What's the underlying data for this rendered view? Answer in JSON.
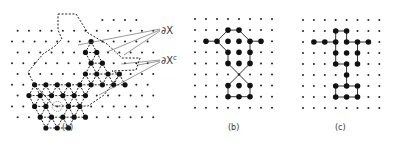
{
  "figure": {
    "panels": [
      {
        "id": "a",
        "caption": "(a)"
      },
      {
        "id": "b",
        "caption": "(b)"
      },
      {
        "id": "c",
        "caption": "(c)"
      }
    ],
    "annotations": {
      "boundary_label": "∂X",
      "complement_boundary_label": "∂X",
      "complement_superscript": "c"
    }
  },
  "panel_a": {
    "lattice": "triangular",
    "origin": [
      12,
      22
    ],
    "dx": 11.3,
    "dy": 10.8,
    "rows": 10,
    "cols": 13,
    "cluster": [
      [
        2,
        7
      ],
      [
        3,
        7
      ],
      [
        3,
        6
      ],
      [
        4,
        7
      ],
      [
        4,
        8
      ],
      [
        5,
        6
      ],
      [
        5,
        7
      ],
      [
        5,
        8
      ],
      [
        5,
        9
      ],
      [
        6,
        2
      ],
      [
        6,
        3
      ],
      [
        6,
        4
      ],
      [
        6,
        5
      ],
      [
        6,
        6
      ],
      [
        6,
        7
      ],
      [
        6,
        8
      ],
      [
        6,
        9
      ],
      [
        6,
        10
      ],
      [
        7,
        1
      ],
      [
        7,
        2
      ],
      [
        7,
        3
      ],
      [
        7,
        4
      ],
      [
        7,
        5
      ],
      [
        7,
        6
      ],
      [
        8,
        2
      ],
      [
        8,
        3
      ],
      [
        8,
        5
      ],
      [
        8,
        6
      ],
      [
        9,
        2
      ],
      [
        9,
        3
      ],
      [
        9,
        4
      ],
      [
        9,
        5
      ],
      [
        9,
        6
      ],
      [
        10,
        3
      ],
      [
        10,
        4
      ],
      [
        10,
        5
      ]
    ],
    "center_circle": [
      8,
      4
    ],
    "colors": {
      "ink": "#111111",
      "leader": "#555555"
    }
  },
  "panel_b": {
    "origin": [
      195,
      19
    ],
    "dx": 11,
    "dy": 11.1,
    "rows": 9,
    "cols": 8,
    "filled": [
      [
        1,
        3
      ],
      [
        1,
        4
      ],
      [
        2,
        1
      ],
      [
        2,
        2
      ],
      [
        2,
        3
      ],
      [
        2,
        4
      ],
      [
        2,
        5
      ],
      [
        2,
        6
      ],
      [
        3,
        3
      ],
      [
        3,
        4
      ],
      [
        3,
        5
      ],
      [
        4,
        3
      ],
      [
        4,
        4
      ],
      [
        4,
        5
      ],
      [
        5,
        4
      ],
      [
        6,
        3
      ],
      [
        6,
        4
      ],
      [
        6,
        5
      ],
      [
        7,
        3
      ],
      [
        7,
        4
      ],
      [
        7,
        5
      ]
    ],
    "edges": [
      [
        [
          2,
          1
        ],
        [
          2,
          2
        ]
      ],
      [
        [
          2,
          2
        ],
        [
          1,
          3
        ]
      ],
      [
        [
          1,
          3
        ],
        [
          1,
          4
        ]
      ],
      [
        [
          1,
          4
        ],
        [
          2,
          5
        ]
      ],
      [
        [
          2,
          5
        ],
        [
          2,
          6
        ]
      ],
      [
        [
          2,
          2
        ],
        [
          3,
          3
        ]
      ],
      [
        [
          3,
          3
        ],
        [
          4,
          3
        ]
      ],
      [
        [
          2,
          5
        ],
        [
          3,
          5
        ]
      ],
      [
        [
          3,
          5
        ],
        [
          4,
          5
        ]
      ],
      [
        [
          4,
          3
        ],
        [
          6,
          5
        ]
      ],
      [
        [
          4,
          5
        ],
        [
          6,
          3
        ]
      ],
      [
        [
          6,
          3
        ],
        [
          7,
          3
        ]
      ],
      [
        [
          7,
          3
        ],
        [
          7,
          4
        ]
      ],
      [
        [
          7,
          4
        ],
        [
          7,
          5
        ]
      ],
      [
        [
          7,
          5
        ],
        [
          6,
          5
        ]
      ]
    ]
  },
  "panel_c": {
    "origin": [
      303,
      20
    ],
    "dx": 10.9,
    "dy": 11,
    "rows": 9,
    "cols": 8,
    "filled": [
      [
        2,
        1
      ],
      [
        2,
        2
      ],
      [
        2,
        3
      ],
      [
        2,
        4
      ],
      [
        2,
        5
      ],
      [
        2,
        6
      ],
      [
        1,
        3
      ],
      [
        1,
        4
      ],
      [
        3,
        3
      ],
      [
        3,
        4
      ],
      [
        3,
        5
      ],
      [
        4,
        3
      ],
      [
        4,
        4
      ],
      [
        4,
        5
      ],
      [
        5,
        4
      ],
      [
        6,
        3
      ],
      [
        6,
        4
      ],
      [
        6,
        5
      ],
      [
        7,
        3
      ],
      [
        7,
        4
      ],
      [
        7,
        5
      ]
    ],
    "edges": [
      [
        [
          2,
          1
        ],
        [
          2,
          2
        ]
      ],
      [
        [
          2,
          2
        ],
        [
          2,
          3
        ]
      ],
      [
        [
          2,
          3
        ],
        [
          1,
          3
        ]
      ],
      [
        [
          1,
          3
        ],
        [
          1,
          4
        ]
      ],
      [
        [
          1,
          4
        ],
        [
          2,
          4
        ]
      ],
      [
        [
          2,
          4
        ],
        [
          2,
          5
        ]
      ],
      [
        [
          2,
          5
        ],
        [
          2,
          6
        ]
      ],
      [
        [
          2,
          3
        ],
        [
          3,
          3
        ]
      ],
      [
        [
          3,
          3
        ],
        [
          4,
          3
        ]
      ],
      [
        [
          4,
          3
        ],
        [
          4,
          4
        ]
      ],
      [
        [
          2,
          5
        ],
        [
          3,
          5
        ]
      ],
      [
        [
          3,
          5
        ],
        [
          4,
          5
        ]
      ],
      [
        [
          4,
          4
        ],
        [
          5,
          4
        ]
      ],
      [
        [
          5,
          4
        ],
        [
          6,
          4
        ]
      ],
      [
        [
          6,
          3
        ],
        [
          6,
          4
        ]
      ],
      [
        [
          6,
          4
        ],
        [
          6,
          5
        ]
      ],
      [
        [
          6,
          5
        ],
        [
          7,
          5
        ]
      ],
      [
        [
          7,
          5
        ],
        [
          7,
          4
        ]
      ],
      [
        [
          7,
          4
        ],
        [
          7,
          3
        ]
      ],
      [
        [
          7,
          3
        ],
        [
          6,
          3
        ]
      ]
    ]
  }
}
